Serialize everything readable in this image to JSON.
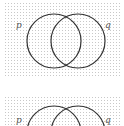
{
  "diagrams": [
    {
      "labels": {
        "left": "p",
        "right": "q"
      }
    },
    {
      "labels": {
        "left": "p",
        "right": "q"
      }
    }
  ],
  "colors": {
    "stroke": "#333333",
    "grid": "#c8c8c8"
  }
}
